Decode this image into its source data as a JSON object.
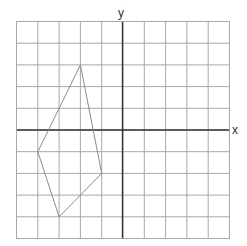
{
  "axes": {
    "x_label": "x",
    "y_label": "y"
  },
  "grid": {
    "xmin": -5,
    "xmax": 5,
    "ymin": -5,
    "ymax": 5,
    "step": 1,
    "line_color": "#a8a8a8",
    "axis_color": "#333333"
  },
  "shape": {
    "type": "quadrilateral",
    "stroke": "#8c8c8c",
    "vertices": [
      {
        "x": -2,
        "y": 3
      },
      {
        "x": -1,
        "y": -2
      },
      {
        "x": -3,
        "y": -4
      },
      {
        "x": -4,
        "y": -1
      }
    ]
  },
  "chart_data": {
    "type": "scatter",
    "title": "",
    "xlabel": "x",
    "ylabel": "y",
    "xlim": [
      -5,
      5
    ],
    "ylim": [
      -5,
      5
    ],
    "grid": true,
    "series": [
      {
        "name": "quadrilateral",
        "closed": true,
        "x": [
          -2,
          -1,
          -3,
          -4
        ],
        "y": [
          3,
          -2,
          -4,
          -1
        ]
      }
    ]
  }
}
